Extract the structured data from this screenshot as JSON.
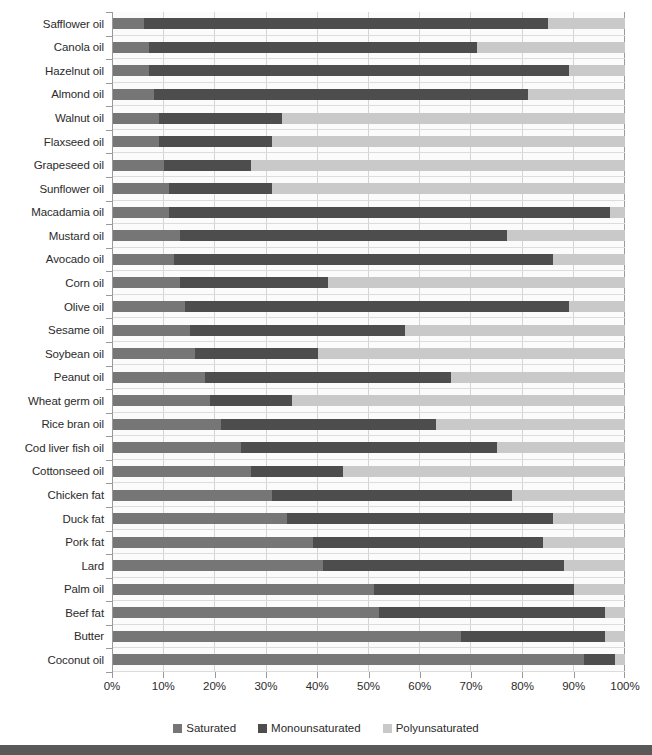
{
  "chart_data": {
    "type": "bar",
    "subtype": "horizontal-stacked-100-percent",
    "title": "",
    "xlabel": "",
    "ylabel": "",
    "xlim": [
      0,
      100
    ],
    "grid": true,
    "legend_position": "bottom-center",
    "tick_labels": [
      "0%",
      "10%",
      "20%",
      "30%",
      "40%",
      "50%",
      "60%",
      "70%",
      "80%",
      "90%",
      "100%"
    ],
    "tick_values": [
      0,
      10,
      20,
      30,
      40,
      50,
      60,
      70,
      80,
      90,
      100
    ],
    "categories": [
      "Safflower oil",
      "Canola oil",
      "Hazelnut oil",
      "Almond oil",
      "Walnut oil",
      "Flaxseed oil",
      "Grapeseed oil",
      "Sunflower oil",
      "Macadamia oil",
      "Mustard oil",
      "Avocado oil",
      "Corn oil",
      "Olive oil",
      "Sesame oil",
      "Soybean oil",
      "Peanut oil",
      "Wheat germ oil",
      "Rice bran oil",
      "Cod liver fish oil",
      "Cottonseed oil",
      "Chicken fat",
      "Duck fat",
      "Pork fat",
      "Lard",
      "Palm oil",
      "Beef fat",
      "Butter",
      "Coconut oil"
    ],
    "series": [
      {
        "name": "Saturated",
        "color": "#767676",
        "values": [
          6,
          7,
          7,
          8,
          9,
          9,
          10,
          11,
          11,
          13,
          12,
          13,
          14,
          15,
          16,
          18,
          19,
          21,
          25,
          27,
          31,
          34,
          39,
          41,
          51,
          52,
          68,
          92
        ]
      },
      {
        "name": "Monounsaturated",
        "color": "#4d4d4d",
        "values": [
          79,
          64,
          82,
          73,
          24,
          22,
          17,
          20,
          86,
          64,
          74,
          29,
          75,
          42,
          24,
          48,
          16,
          42,
          50,
          18,
          47,
          52,
          45,
          47,
          39,
          44,
          28,
          6
        ]
      },
      {
        "name": "Polyunsaturated",
        "color": "#c9c9c9",
        "values": [
          15,
          29,
          11,
          19,
          67,
          69,
          73,
          69,
          3,
          23,
          14,
          58,
          11,
          43,
          60,
          34,
          65,
          37,
          25,
          55,
          22,
          14,
          16,
          12,
          10,
          4,
          4,
          2
        ]
      }
    ],
    "cumulative_boundaries": [
      [
        6,
        85
      ],
      [
        7,
        71
      ],
      [
        7,
        89
      ],
      [
        8,
        81
      ],
      [
        9,
        33
      ],
      [
        9,
        31
      ],
      [
        10,
        27
      ],
      [
        11,
        31
      ],
      [
        11,
        97
      ],
      [
        13,
        77
      ],
      [
        12,
        86
      ],
      [
        13,
        42
      ],
      [
        14,
        89
      ],
      [
        15,
        57
      ],
      [
        16,
        40
      ],
      [
        18,
        66
      ],
      [
        19,
        35
      ],
      [
        21,
        63
      ],
      [
        25,
        75
      ],
      [
        27,
        45
      ],
      [
        31,
        78
      ],
      [
        34,
        86
      ],
      [
        39,
        84
      ],
      [
        41,
        88
      ],
      [
        51,
        90
      ],
      [
        52,
        96
      ],
      [
        68,
        96
      ],
      [
        92,
        98
      ]
    ]
  },
  "legend": {
    "items": [
      {
        "label": "Saturated",
        "color": "#767676"
      },
      {
        "label": "Monounsaturated",
        "color": "#4d4d4d"
      },
      {
        "label": "Polyunsaturated",
        "color": "#c9c9c9"
      }
    ]
  }
}
